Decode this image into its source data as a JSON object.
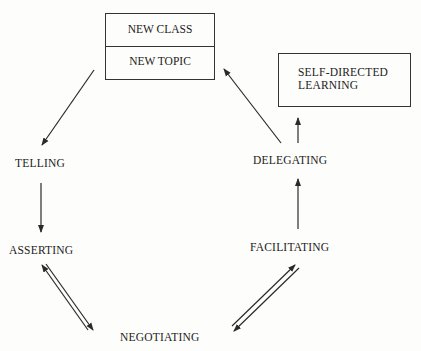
{
  "diagram": {
    "type": "cycle-flow",
    "start_box": {
      "top": "NEW CLASS",
      "bottom": "NEW TOPIC"
    },
    "end_box": {
      "line1": "SELF-DIRECTED",
      "line2": "LEARNING"
    },
    "stages": {
      "telling": "TELLING",
      "asserting": "ASSERTING",
      "negotiating": "NEGOTIATING",
      "facilitating": "FACILITATING",
      "delegating": "DELEGATING"
    },
    "edges": [
      {
        "from": "NEW CLASS / NEW TOPIC",
        "to": "TELLING",
        "direction": "one-way"
      },
      {
        "from": "TELLING",
        "to": "ASSERTING",
        "direction": "one-way"
      },
      {
        "from": "ASSERTING",
        "to": "NEGOTIATING",
        "direction": "two-way"
      },
      {
        "from": "NEGOTIATING",
        "to": "FACILITATING",
        "direction": "two-way"
      },
      {
        "from": "FACILITATING",
        "to": "DELEGATING",
        "direction": "one-way"
      },
      {
        "from": "DELEGATING",
        "to": "NEW CLASS / NEW TOPIC",
        "direction": "one-way"
      },
      {
        "from": "DELEGATING",
        "to": "SELF-DIRECTED LEARNING",
        "direction": "one-way"
      }
    ],
    "line_color": "#2a2a2a"
  }
}
